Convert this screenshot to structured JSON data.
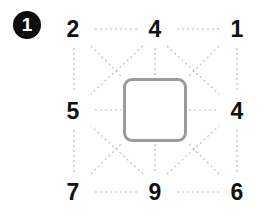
{
  "diagram": {
    "step_badge": {
      "label": "1"
    },
    "grid": {
      "rows": 3,
      "cols": 3,
      "cells": [
        {
          "position": "top-left",
          "label": "2"
        },
        {
          "position": "top-middle",
          "label": "4"
        },
        {
          "position": "top-right",
          "label": "1"
        },
        {
          "position": "middle-left",
          "label": "5"
        },
        {
          "position": "middle-center",
          "label": ""
        },
        {
          "position": "middle-right",
          "label": "4"
        },
        {
          "position": "bottom-left",
          "label": "7"
        },
        {
          "position": "bottom-middle",
          "label": "9"
        },
        {
          "position": "bottom-right",
          "label": "6"
        }
      ]
    },
    "center_shape": {
      "kind": "rounded-square",
      "border_color": "#9b9b9b",
      "fill_color": "#ffffff"
    },
    "connector_lines": {
      "style": "dotted",
      "color": "#b9b9b9"
    },
    "colors": {
      "badge_background": "#0d0d0d",
      "badge_text": "#ffffff",
      "label_text": "#111111",
      "page_background": "#ffffff"
    }
  }
}
